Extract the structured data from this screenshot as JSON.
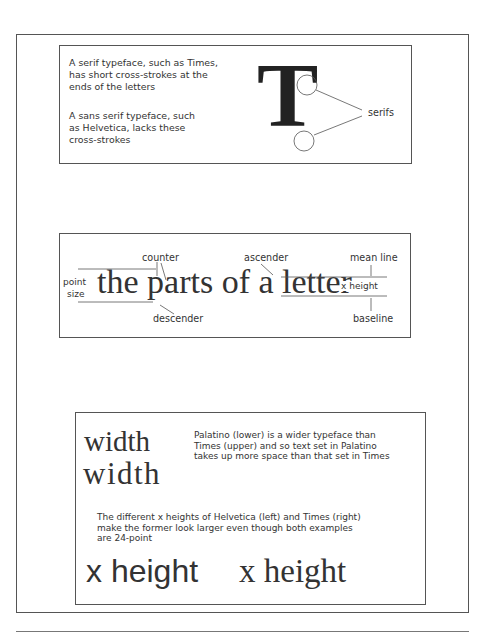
{
  "panel_serifs": {
    "serif_text": "A serif typeface, such as Times, has short cross-strokes at the ends of the letters",
    "serif_lines": [
      "A serif typeface, such as Times,",
      "has short cross-strokes at the",
      "ends of the letters"
    ],
    "sans_lines": [
      "A sans serif typeface, such",
      "as Helvetica, lacks these",
      "cross-strokes"
    ],
    "big_letter": "T",
    "callout_label": "serifs"
  },
  "panel_anatomy": {
    "sample_text_1": "the ",
    "sample_text_2": "parts of a ",
    "sample_text_3": "letter",
    "labels": {
      "counter": "counter",
      "ascender": "ascender",
      "mean_line": "mean line",
      "point": "point",
      "size": "size",
      "x_height": "x height",
      "descender": "descender",
      "baseline": "baseline"
    }
  },
  "panel_width": {
    "word_times": "width",
    "word_palatino": "width",
    "width_caption_lines": [
      "Palatino (lower) is a wider typeface than",
      "Times (upper) and so text set in Palatino",
      "takes up more space than that set in Times"
    ],
    "xheight_caption_lines": [
      "The different x heights of Helvetica (left) and Times (right)",
      "make the former look larger even though both examples",
      "are 24-point"
    ],
    "sample_helvetica": "x height",
    "sample_times": "x height"
  }
}
